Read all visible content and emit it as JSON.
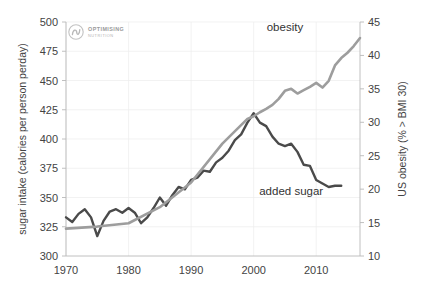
{
  "chart_data": {
    "type": "line",
    "title": "",
    "subtitle": "",
    "xlabel": "",
    "ylabel": "sugar intake (calories per person perday)",
    "y2label": "US obesity (% > BMI 30)",
    "xlim": [
      1970,
      2017
    ],
    "ylim": [
      300,
      500
    ],
    "y2lim": [
      10,
      45
    ],
    "grid": true,
    "legend_position": "inline-annotation",
    "x_ticks": [
      "1970",
      "1980",
      "1990",
      "2000",
      "2010"
    ],
    "x_tick_values": [
      1970,
      1980,
      1990,
      2000,
      2010
    ],
    "y_ticks": [
      "300",
      "325",
      "350",
      "375",
      "400",
      "425",
      "450",
      "475",
      "500"
    ],
    "y_tick_values": [
      300,
      325,
      350,
      375,
      400,
      425,
      450,
      475,
      500
    ],
    "y2_ticks": [
      "10",
      "15",
      "20",
      "25",
      "30",
      "35",
      "40",
      "45"
    ],
    "y2_tick_values": [
      10,
      15,
      20,
      25,
      30,
      35,
      40,
      45
    ],
    "series": [
      {
        "name": "added sugar",
        "axis": "left",
        "color": "#4a4a4a",
        "label_text": "added sugar",
        "label_x": 2006,
        "label_y": 352,
        "x": [
          1970,
          1971,
          1972,
          1973,
          1974,
          1975,
          1976,
          1977,
          1978,
          1979,
          1980,
          1981,
          1982,
          1983,
          1984,
          1985,
          1986,
          1987,
          1988,
          1989,
          1990,
          1991,
          1992,
          1993,
          1994,
          1995,
          1996,
          1997,
          1998,
          1999,
          2000,
          2001,
          2002,
          2003,
          2004,
          2005,
          2006,
          2007,
          2008,
          2009,
          2010,
          2011,
          2012,
          2013,
          2014
        ],
        "values": [
          333,
          329,
          336,
          340,
          333,
          317,
          330,
          338,
          340,
          337,
          341,
          337,
          328,
          333,
          341,
          350,
          343,
          352,
          359,
          357,
          365,
          367,
          373,
          372,
          380,
          384,
          390,
          399,
          404,
          414,
          422,
          414,
          411,
          402,
          396,
          394,
          396,
          389,
          378,
          377,
          365,
          362,
          359,
          360,
          360
        ]
      },
      {
        "name": "obesity",
        "axis": "right",
        "color": "#9d9d9d",
        "label_text": "obesity",
        "label_x": 2005,
        "label_y": 43.6,
        "x": [
          1970,
          1975,
          1980,
          1985,
          1990,
          1995,
          1999,
          2000,
          2001,
          2002,
          2003,
          2004,
          2005,
          2006,
          2007,
          2008,
          2009,
          2010,
          2011,
          2012,
          2013,
          2014,
          2015,
          2016,
          2017
        ],
        "values": [
          14.1,
          14.4,
          14.9,
          17.3,
          21.0,
          26.8,
          30.5,
          30.9,
          31.5,
          32.0,
          32.6,
          33.5,
          34.7,
          35.0,
          34.3,
          34.8,
          35.3,
          35.9,
          35.2,
          36.2,
          38.5,
          39.6,
          40.4,
          41.4,
          42.6
        ]
      }
    ]
  },
  "branding": {
    "logo_name": "optimising-nutrition-logo",
    "logo_line1": "OPTIMISING",
    "logo_line2": "NUTRITION"
  },
  "colors": {
    "added_sugar": "#4a4a4a",
    "obesity": "#9d9d9d",
    "grid": "#ededed",
    "axis": "#b9b9b9",
    "text": "#434343",
    "background": "#ffffff"
  }
}
